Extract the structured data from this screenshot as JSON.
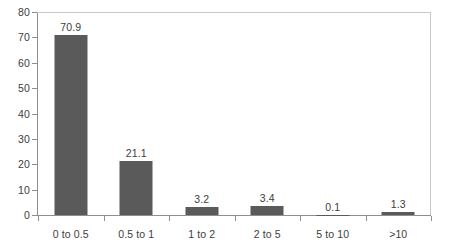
{
  "chart_data": {
    "type": "bar",
    "title": "",
    "subtitle": "",
    "xlabel": "",
    "ylabel": "",
    "categories": [
      "0 to 0.5",
      "0.5 to 1",
      "1 to 2",
      "2 to 5",
      "5 to 10",
      ">10"
    ],
    "values": [
      70.9,
      21.1,
      3.2,
      3.4,
      0.1,
      1.3
    ],
    "value_labels": [
      "70.9",
      "21.1",
      "3.2",
      "3.4",
      "0.1",
      "1.3"
    ],
    "ylim": [
      0,
      80
    ],
    "ytick_values": [
      0,
      10,
      20,
      30,
      40,
      50,
      60,
      70,
      80
    ],
    "ytick_labels": [
      "0",
      "10",
      "20",
      "30",
      "40",
      "50",
      "60",
      "70",
      "80"
    ],
    "grid": false,
    "legend": false,
    "legend_position": "none",
    "bar_color": "#5a5a5a",
    "axis_color": "#8e8e8e",
    "frame_color": "#c9c9c9",
    "text_color": "#3d3d3d",
    "background_color": "#ffffff"
  }
}
